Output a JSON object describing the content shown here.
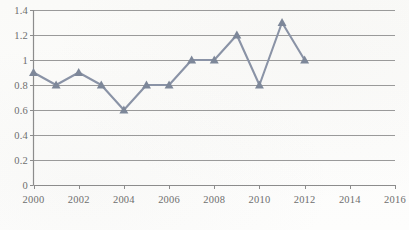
{
  "chart_data": {
    "type": "line",
    "title": "",
    "subtitle": "",
    "xlabel": "",
    "ylabel": "",
    "x": [
      2000,
      2001,
      2002,
      2003,
      2004,
      2005,
      2006,
      2007,
      2008,
      2009,
      2010,
      2011,
      2012
    ],
    "values": [
      0.9,
      0.8,
      0.9,
      0.8,
      0.6,
      0.8,
      0.8,
      1.0,
      1.0,
      1.2,
      0.8,
      1.3,
      1.0
    ],
    "series": [
      {
        "name": "Series 1",
        "values": [
          0.9,
          0.8,
          0.9,
          0.8,
          0.6,
          0.8,
          0.8,
          1.0,
          1.0,
          1.2,
          0.8,
          1.3,
          1.0
        ]
      }
    ],
    "xlim": [
      2000,
      2016
    ],
    "ylim": [
      0,
      1.4
    ],
    "ytick_labels": [
      "0",
      "0.2",
      "0.4",
      "0.6",
      "0.8",
      "1",
      "1.2",
      "1.4"
    ],
    "ytick_values": [
      0,
      0.2,
      0.4,
      0.6,
      0.8,
      1.0,
      1.2,
      1.4
    ],
    "xtick_labels": [
      "2000",
      "2002",
      "2004",
      "2006",
      "2008",
      "2010",
      "2012",
      "2014",
      "2016"
    ],
    "xtick_values": [
      2000,
      2002,
      2004,
      2006,
      2008,
      2010,
      2012,
      2014,
      2016
    ],
    "grid": "horizontal",
    "legend": "none",
    "marker": "triangle",
    "annotations": [],
    "colors": {
      "line": "#8a93a6",
      "marker": "#7d8799",
      "grid": "#9a9a9a",
      "axis": "#8c8c8c",
      "tick_label": "#6e6e6e",
      "background": "#fdfdfc"
    }
  }
}
